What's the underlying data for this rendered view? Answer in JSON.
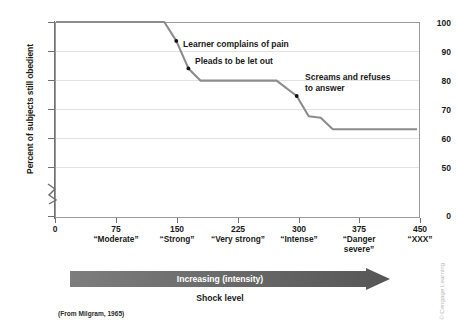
{
  "chart_data": {
    "type": "line",
    "title": "",
    "xlabel": "Shock level",
    "ylabel": "Percent of subjects still obedient",
    "xlim": [
      0,
      450
    ],
    "ylim": [
      50,
      100
    ],
    "yaxis_break": true,
    "grid": true,
    "legend_position": "none",
    "source_note": "(From Milgram, 1965)",
    "credit": "© Cengage Learning",
    "y_ticks": [
      0,
      50,
      60,
      70,
      80,
      90,
      100
    ],
    "x_ticks": [
      0,
      75,
      150,
      225,
      300,
      375,
      450
    ],
    "x_tick_labels": [
      "0",
      "75",
      "150",
      "225",
      "300",
      "375",
      "450"
    ],
    "x_category_labels": [
      "",
      "“Moderate”",
      "“Strong”",
      "“Very strong”",
      "“Intense”",
      "“Danger severe”",
      "“XXX”"
    ],
    "series": [
      {
        "name": "Percent of subjects still obedient",
        "color": "#8c8c8c",
        "x": [
          0,
          135,
          150,
          165,
          180,
          275,
          300,
          315,
          330,
          345,
          450
        ],
        "y": [
          100,
          100,
          93.5,
          84,
          79.8,
          79.8,
          74.5,
          67.5,
          67,
          63,
          63
        ]
      }
    ],
    "annotations": [
      {
        "text": "Learner complains of pain",
        "x": 150,
        "y": 93.5,
        "marker": true
      },
      {
        "text": "Pleads to be let out",
        "x": 165,
        "y": 84,
        "marker": true
      },
      {
        "text": "Screams and refuses to answer",
        "line1": "Screams and refuses",
        "line2": "to answer",
        "x": 300,
        "y": 74.5,
        "marker": true
      }
    ],
    "arrow": {
      "label": "Increasing (intensity)",
      "direction": "right",
      "color_start": "#7d7d7d",
      "color_end": "#5b5b5b"
    }
  }
}
